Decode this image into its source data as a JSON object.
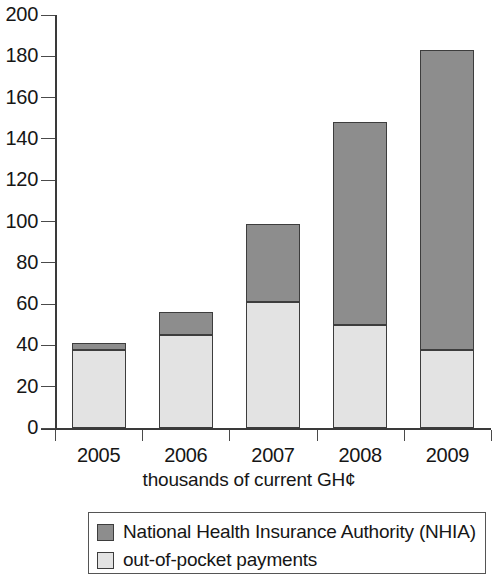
{
  "chart_data": {
    "type": "bar",
    "subtype": "stacked-bar",
    "title": "",
    "xlabel": "thousands of current GH¢",
    "ylabel": "",
    "categories": [
      "2005",
      "2006",
      "2007",
      "2008",
      "2009"
    ],
    "ylim": [
      0,
      200
    ],
    "ytick_step": 20,
    "yticks": [
      "200",
      "180",
      "160",
      "140",
      "120",
      "100",
      "80",
      "60",
      "40",
      "20",
      "0"
    ],
    "grid": false,
    "legend_position": "bottom",
    "series": [
      {
        "name": "National Health Insurance Authority (NHIA)",
        "color": "#8d8d8d",
        "values": [
          3,
          11,
          38,
          98,
          145
        ]
      },
      {
        "name": "out-of-pocket payments",
        "color": "#e3e3e3",
        "values": [
          38,
          45,
          61,
          50,
          38
        ]
      }
    ],
    "totals": [
      41,
      56,
      99,
      148,
      183
    ]
  },
  "legend": {
    "items": [
      {
        "label": "National Health Insurance Authority (NHIA)",
        "color": "#8d8d8d"
      },
      {
        "label": "out-of-pocket payments",
        "color": "#e3e3e3"
      }
    ]
  },
  "axis": {
    "x_title": "thousands of current GH¢"
  }
}
